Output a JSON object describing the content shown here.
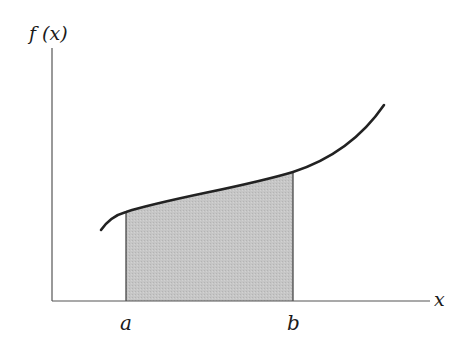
{
  "figure": {
    "type": "definite-integral-area",
    "y_axis_label": "f (x)",
    "x_axis_label": "x",
    "lower_bound_label": "a",
    "upper_bound_label": "b",
    "colors": {
      "axis": "#444444",
      "curve": "#222222",
      "shaded_region": "#c4c4c4",
      "background": "#ffffff"
    }
  }
}
